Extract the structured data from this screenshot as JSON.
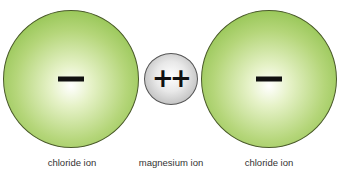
{
  "diagram": {
    "ions": [
      {
        "name": "chloride ion",
        "charge": "−",
        "color": "#8cc049"
      },
      {
        "name": "magnesium ion",
        "charge": "++",
        "color": "#bdbdbd"
      },
      {
        "name": "chloride ion",
        "charge": "−",
        "color": "#8cc049"
      }
    ]
  }
}
